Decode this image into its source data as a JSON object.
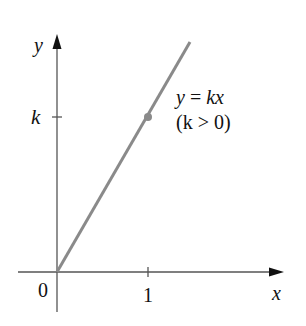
{
  "figure": {
    "axis_labels": {
      "x": "x",
      "y": "y"
    },
    "origin_label": "0",
    "x_tick_label": "1",
    "y_tick_label": "k",
    "equation_line1_y": "y",
    "equation_line1_eq": " = ",
    "equation_line1_rhs": "kx",
    "equation_line2": "(k > 0)",
    "colors": {
      "axis": "#555555",
      "line": "#8a8a8a",
      "point": "#8a8a8a",
      "text": "#111111"
    }
  }
}
